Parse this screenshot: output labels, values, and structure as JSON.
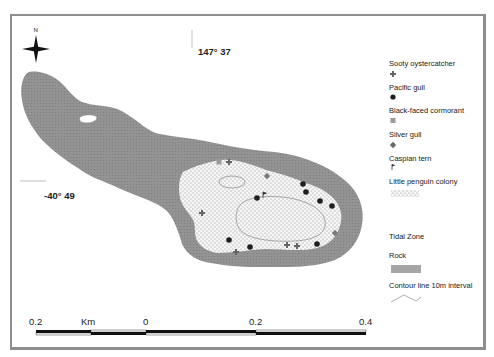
{
  "map": {
    "north_label": "N",
    "longitude_label": "147° 37",
    "latitude_label": "-40° 49",
    "colors": {
      "rock": "#8f8f8f",
      "penguin_colony": "#f4f4f4",
      "frame": "#8e8e8e",
      "marker_dark": "#1e1e1e",
      "marker_grey": "#7a7a7a"
    }
  },
  "legend": {
    "items": [
      {
        "label": "Sooty oystercatcher",
        "symbol": "cross"
      },
      {
        "label": "Pacific gull",
        "symbol": "dot"
      },
      {
        "label": "Black-faced cormorant",
        "symbol": "square"
      },
      {
        "label": "Silver gull",
        "symbol": "diamond-cross"
      },
      {
        "label": "Caspian tern",
        "symbol": "flag"
      },
      {
        "label": "Little penguin colony",
        "symbol": "stipple"
      },
      {
        "label": "Tidal Zone",
        "symbol": "none"
      },
      {
        "label": "Rock",
        "symbol": "grey-rect"
      },
      {
        "label": "Contour line 10m interval",
        "symbol": "zigzag"
      }
    ]
  },
  "scale_bar": {
    "unit": "Km",
    "ticks": [
      "0.2",
      "0",
      "0.2",
      "0.4"
    ]
  }
}
